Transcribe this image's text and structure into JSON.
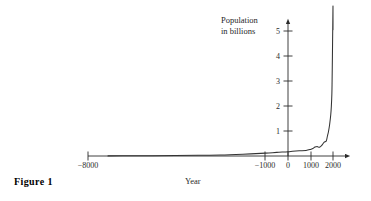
{
  "figure": {
    "caption": "Figure 1",
    "background_color": "#ffffff",
    "line_color": "#333333",
    "axis_color": "#2b2b2b"
  },
  "chart_data": {
    "type": "line",
    "title": "",
    "subtitle": "",
    "xlabel": "Year",
    "ylabel": "Population in billions",
    "ylabel_lines": [
      "Population",
      "in billions"
    ],
    "xlim": [
      -8000,
      2400
    ],
    "ylim": [
      0,
      5.4
    ],
    "grid": false,
    "legend": null,
    "xticks": [
      -1000,
      0,
      1000,
      2000
    ],
    "xtick_labels": [
      "−1000",
      "0",
      "1000",
      "2000"
    ],
    "x_axis_start_label": "−8000",
    "x_axis_start_value": -8000,
    "yticks": [
      1,
      2,
      3,
      4,
      5
    ],
    "ytick_labels": [
      "1",
      "2",
      "3",
      "4",
      "5"
    ],
    "axis_arrows": [
      "x-right",
      "y-up"
    ],
    "series": [
      {
        "name": "World population",
        "x": [
          -8000,
          -7000,
          -6000,
          -5000,
          -4000,
          -3000,
          -2000,
          -1000,
          -500,
          0,
          200,
          500,
          800,
          1000,
          1100,
          1200,
          1300,
          1340,
          1400,
          1500,
          1600,
          1700,
          1750,
          1800,
          1850,
          1900,
          1927,
          1950,
          1960,
          1974,
          1987,
          1999,
          2000
        ],
        "y": [
          0.005,
          0.008,
          0.012,
          0.018,
          0.028,
          0.04,
          0.072,
          0.115,
          0.145,
          0.17,
          0.19,
          0.21,
          0.22,
          0.265,
          0.3,
          0.36,
          0.38,
          0.36,
          0.35,
          0.425,
          0.545,
          0.6,
          0.79,
          0.98,
          1.26,
          1.65,
          2.0,
          2.5,
          3.0,
          4.0,
          5.0,
          6.0,
          5.05
        ]
      }
    ]
  },
  "axis_geometry": {
    "x_axis_y_px": 156,
    "y_axis_x_px": 288,
    "px_per_year": 0.0225,
    "px_per_billion": 25
  }
}
